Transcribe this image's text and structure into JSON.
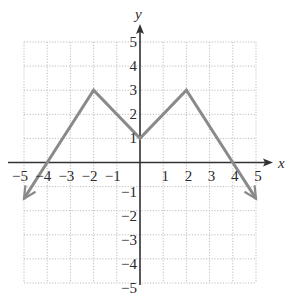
{
  "chart_data": {
    "type": "line",
    "title": "",
    "xlabel": "x",
    "ylabel": "y",
    "xlim": [
      -5,
      5
    ],
    "ylim": [
      -5,
      5
    ],
    "grid": true,
    "grid_style": "dotted",
    "x_ticks": [
      -5,
      -4,
      -3,
      -2,
      -1,
      1,
      2,
      3,
      4,
      5
    ],
    "y_ticks": [
      -5,
      -4,
      -3,
      -2,
      -1,
      1,
      2,
      3,
      4,
      5
    ],
    "x_tick_labels": [
      "−5",
      "−4",
      "−3",
      "−2",
      "−1",
      "1",
      "2",
      "3",
      "4",
      "5"
    ],
    "y_tick_labels": [
      "−5",
      "−4",
      "−3",
      "−2",
      "−1",
      "1",
      "2",
      "3",
      "4",
      "5"
    ],
    "series": [
      {
        "name": "f(x)",
        "x": [
          -5,
          -4,
          -2,
          0,
          2,
          4,
          5
        ],
        "y": [
          -1.5,
          0,
          3,
          1,
          3,
          0,
          -1.5
        ],
        "arrows": "both-ends",
        "color": "#8a8a8a"
      }
    ],
    "key_points": {
      "peaks": [
        [
          -2,
          3
        ],
        [
          2,
          3
        ]
      ],
      "valley": [
        0,
        1
      ],
      "x_intercepts": [
        -4,
        4
      ],
      "y_intercept": 1
    }
  },
  "colors": {
    "line": "#8a8a8a",
    "axis": "#333333",
    "grid": "#bdbdbd",
    "text": "#2a2a2a"
  }
}
